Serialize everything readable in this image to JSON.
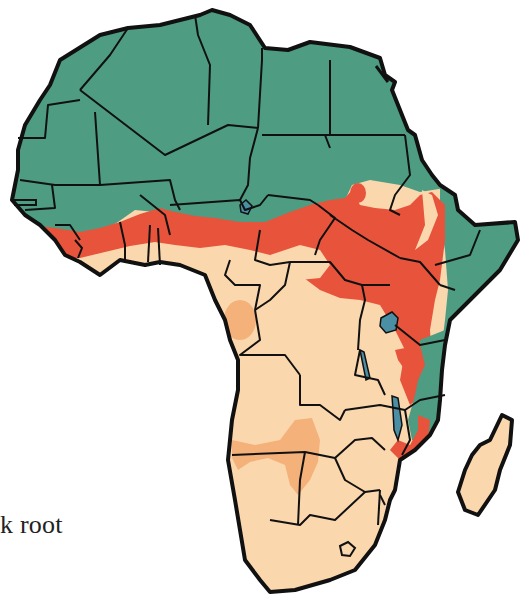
{
  "caption": "k root",
  "map": {
    "subject": "Africa",
    "colors": {
      "green_zone": "#4e9d82",
      "red_zone": "#e8533b",
      "peach_zone": "#fbd7ae",
      "light_orange_zone": "#f4b27a",
      "lake": "#4a8fa3",
      "border": "#111111",
      "background": "#ffffff"
    },
    "legend_categories": [
      "green",
      "red",
      "peach",
      "light-orange",
      "lake"
    ]
  }
}
